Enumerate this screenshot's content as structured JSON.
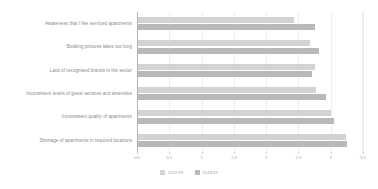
{
  "chart_data": {
    "type": "bar",
    "orientation": "horizontal",
    "title": "",
    "subtitle": "",
    "xlabel": "",
    "ylabel": "",
    "xlim": [
      0,
      3.5
    ],
    "grid": true,
    "legend_position": "bottom",
    "xticks": [
      0,
      0.5,
      1,
      1.5,
      2,
      2.5,
      3,
      3.5
    ],
    "xticklabels": [
      "0%",
      "0.5",
      "1",
      "1.5",
      "2",
      "2.5",
      "3",
      "3.5"
    ],
    "categories": [
      "Awareness that I like serviced apartments",
      "Booking process takes too long",
      "Lack of recognised brands in the sector",
      "Inconsistent levels of guest services and amenities",
      "Inconsistent quality of apartments",
      "Shortage of apartments in required locations"
    ],
    "series": [
      {
        "name": "2017/18",
        "color": "#d3d3d3",
        "values": [
          2.43,
          2.68,
          2.75,
          2.77,
          3.0,
          3.23
        ]
      },
      {
        "name": "2018/19",
        "color": "#b9b9b9",
        "values": [
          2.75,
          2.82,
          2.7,
          2.92,
          3.05,
          3.25
        ]
      }
    ]
  }
}
